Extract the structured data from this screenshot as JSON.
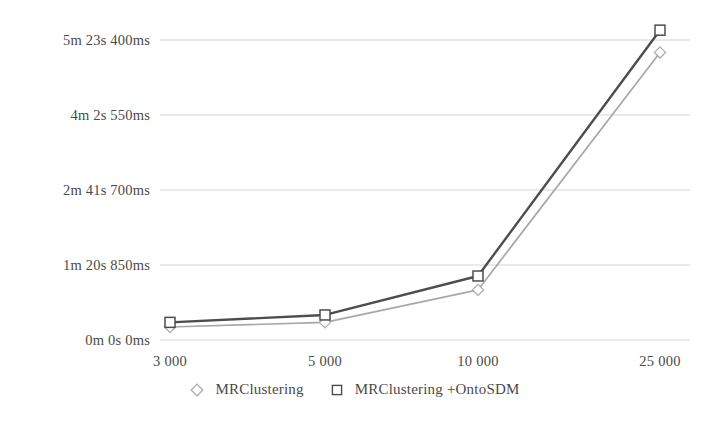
{
  "chart_data": {
    "type": "line",
    "title": "",
    "xlabel": "",
    "ylabel": "",
    "categories": [
      "3 000",
      "5 000",
      "10 000",
      "25 000"
    ],
    "x_tick_labels": [
      "3 000",
      "5 000",
      "10 000",
      "25 000"
    ],
    "y_tick_labels": [
      "0m 0s 0ms",
      "1m 20s 850ms",
      "2m 41s 700ms",
      "4m 2s 550ms",
      "5m 23s 400ms"
    ],
    "y_tick_values_seconds": [
      0,
      80.85,
      161.7,
      242.55,
      323.4
    ],
    "ylim_seconds": [
      0,
      323.4
    ],
    "grid": true,
    "legend_position": "bottom",
    "series": [
      {
        "name": "MRClustering",
        "marker": "diamond",
        "color": "#a8a8a8",
        "values_seconds": [
          14,
          19,
          54,
          310
        ],
        "value_labels": [
          "0m 14s",
          "0m 19s",
          "0m 54s",
          "5m 10s"
        ]
      },
      {
        "name": "MRClustering +OntoSDM",
        "marker": "square",
        "color": "#4d4d4d",
        "values_seconds": [
          19,
          27,
          69,
          334
        ],
        "value_labels": [
          "0m 19s",
          "0m 27s",
          "1m 9s",
          "5m 34s"
        ]
      }
    ]
  },
  "legend": {
    "entries": [
      {
        "label": "MRClustering",
        "marker": "diamond-marker-icon"
      },
      {
        "label": "MRClustering +OntoSDM",
        "marker": "square-marker-icon"
      }
    ]
  },
  "colors": {
    "series_light": "#a8a8a8",
    "series_dark": "#4d4d4d",
    "grid": "#cfcfcf",
    "text": "#4a4a4a",
    "background": "#ffffff"
  }
}
